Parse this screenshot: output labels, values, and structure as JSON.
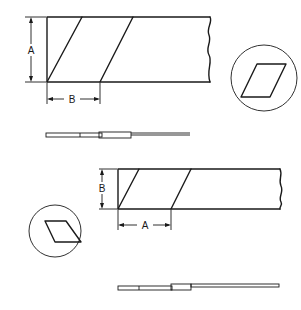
{
  "diagram": {
    "type": "technical-drawing",
    "colors": {
      "line": "#1a1a1a",
      "background": "#ffffff"
    },
    "views": [
      {
        "id": "top-view",
        "dimension_labels": {
          "vertical": "A",
          "horizontal": "B"
        },
        "detail_inset": "parallelogram-cross-section"
      },
      {
        "id": "top-side-profile",
        "description": "overlap-joint-profile"
      },
      {
        "id": "bottom-view",
        "dimension_labels": {
          "vertical": "B",
          "horizontal": "A"
        },
        "detail_inset": "parallelogram-cross-section"
      },
      {
        "id": "bottom-side-profile",
        "description": "overlap-joint-profile"
      }
    ]
  }
}
